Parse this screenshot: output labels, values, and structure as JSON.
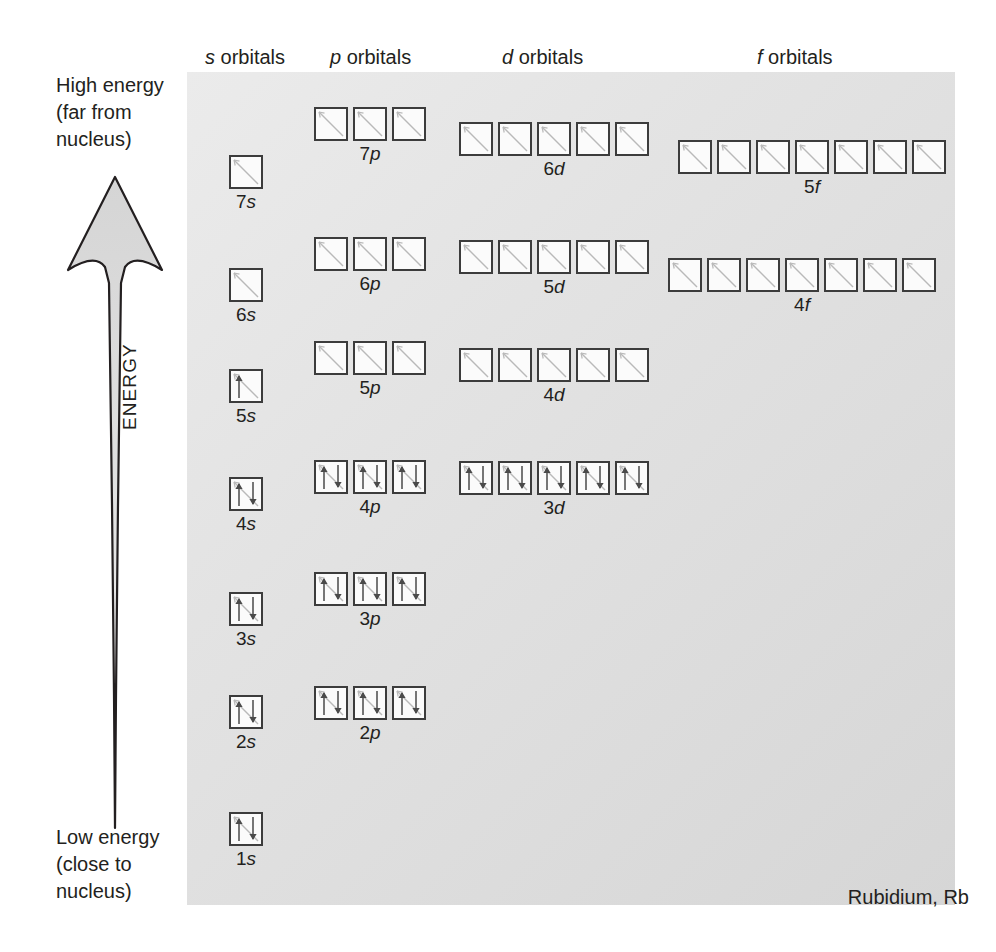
{
  "element": {
    "label": "Rubidium, Rb"
  },
  "axis": {
    "top_lines": [
      "High energy",
      "(far from",
      "nucleus)"
    ],
    "bottom_lines": [
      "Low energy",
      "(close to",
      "nucleus)"
    ],
    "vertical_label": "ENERGY",
    "arrow_direction": "up",
    "arrow_fill": "#d9d9d9",
    "arrow_stroke": "#231f20"
  },
  "headers": [
    {
      "letter": "s",
      "text": " orbitals",
      "x": 205,
      "y": 46
    },
    {
      "letter": "p",
      "text": " orbitals",
      "x": 330,
      "y": 46
    },
    {
      "letter": "d",
      "text": " orbitals",
      "x": 502,
      "y": 46
    },
    {
      "letter": "f",
      "text": " orbitals",
      "x": 757,
      "y": 46
    }
  ],
  "panel": {
    "background_top": "#ebebeb",
    "background_bottom": "#d6d6d6"
  },
  "groups": [
    {
      "name": "7p",
      "n": "7",
      "l": "p",
      "x": 314,
      "y": 107,
      "boxes": [
        "empty",
        "empty",
        "empty"
      ]
    },
    {
      "name": "6d",
      "n": "6",
      "l": "d",
      "x": 459,
      "y": 122,
      "boxes": [
        "empty",
        "empty",
        "empty",
        "empty",
        "empty"
      ]
    },
    {
      "name": "5f",
      "n": "5",
      "l": "f",
      "x": 678,
      "y": 140,
      "boxes": [
        "empty",
        "empty",
        "empty",
        "empty",
        "empty",
        "empty",
        "empty"
      ]
    },
    {
      "name": "7s",
      "n": "7",
      "l": "s",
      "x": 229,
      "y": 155,
      "boxes": [
        "empty"
      ]
    },
    {
      "name": "6p",
      "n": "6",
      "l": "p",
      "x": 314,
      "y": 237,
      "boxes": [
        "empty",
        "empty",
        "empty"
      ]
    },
    {
      "name": "5d",
      "n": "5",
      "l": "d",
      "x": 459,
      "y": 240,
      "boxes": [
        "empty",
        "empty",
        "empty",
        "empty",
        "empty"
      ]
    },
    {
      "name": "4f",
      "n": "4",
      "l": "f",
      "x": 668,
      "y": 258,
      "boxes": [
        "empty",
        "empty",
        "empty",
        "empty",
        "empty",
        "empty",
        "empty"
      ]
    },
    {
      "name": "6s",
      "n": "6",
      "l": "s",
      "x": 229,
      "y": 268,
      "boxes": [
        "empty"
      ]
    },
    {
      "name": "5p",
      "n": "5",
      "l": "p",
      "x": 314,
      "y": 341,
      "boxes": [
        "empty",
        "empty",
        "empty"
      ]
    },
    {
      "name": "4d",
      "n": "4",
      "l": "d",
      "x": 459,
      "y": 348,
      "boxes": [
        "empty",
        "empty",
        "empty",
        "empty",
        "empty"
      ]
    },
    {
      "name": "5s",
      "n": "5",
      "l": "s",
      "x": 229,
      "y": 369,
      "boxes": [
        "up"
      ]
    },
    {
      "name": "4p",
      "n": "4",
      "l": "p",
      "x": 314,
      "y": 460,
      "boxes": [
        "pair",
        "pair",
        "pair"
      ]
    },
    {
      "name": "3d",
      "n": "3",
      "l": "d",
      "x": 459,
      "y": 461,
      "boxes": [
        "pair",
        "pair",
        "pair",
        "pair",
        "pair"
      ]
    },
    {
      "name": "4s",
      "n": "4",
      "l": "s",
      "x": 229,
      "y": 477,
      "boxes": [
        "pair"
      ]
    },
    {
      "name": "3p",
      "n": "3",
      "l": "p",
      "x": 314,
      "y": 572,
      "boxes": [
        "pair",
        "pair",
        "pair"
      ]
    },
    {
      "name": "3s",
      "n": "3",
      "l": "s",
      "x": 229,
      "y": 592,
      "boxes": [
        "pair"
      ]
    },
    {
      "name": "2p",
      "n": "2",
      "l": "p",
      "x": 314,
      "y": 686,
      "boxes": [
        "pair",
        "pair",
        "pair"
      ]
    },
    {
      "name": "2s",
      "n": "2",
      "l": "s",
      "x": 229,
      "y": 695,
      "boxes": [
        "pair"
      ]
    },
    {
      "name": "1s",
      "n": "1",
      "l": "s",
      "x": 229,
      "y": 812,
      "boxes": [
        "pair"
      ]
    }
  ]
}
